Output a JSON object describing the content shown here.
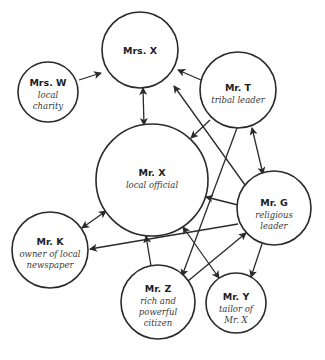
{
  "diagram": {
    "type": "influence network",
    "nodes": [
      {
        "id": "mrs_x",
        "name": "Mrs. X",
        "desc": [],
        "cx": 140,
        "cy": 50,
        "r": 38
      },
      {
        "id": "mrs_w",
        "name": "Mrs. W",
        "desc": [
          "local",
          "charity"
        ],
        "cx": 48,
        "cy": 92,
        "r": 30
      },
      {
        "id": "mr_t",
        "name": "Mr. T",
        "desc": [
          "tribal leader"
        ],
        "cx": 238,
        "cy": 90,
        "r": 38
      },
      {
        "id": "mr_x",
        "name": "Mr. X",
        "desc": [
          "local official"
        ],
        "cx": 152,
        "cy": 180,
        "r": 56
      },
      {
        "id": "mr_g",
        "name": "Mr. G",
        "desc": [
          "religious",
          "leader"
        ],
        "cx": 274,
        "cy": 208,
        "r": 37
      },
      {
        "id": "mr_k",
        "name": "Mr. K",
        "desc": [
          "owner of local",
          "newspaper"
        ],
        "cx": 50,
        "cy": 250,
        "r": 38
      },
      {
        "id": "mr_z",
        "name": "Mr. Z",
        "desc": [
          "rich and",
          "powerful",
          "citizen"
        ],
        "cx": 158,
        "cy": 302,
        "r": 37
      },
      {
        "id": "mr_y",
        "name": "Mr. Y",
        "desc": [
          "tailor of",
          "Mr. X"
        ],
        "cx": 236,
        "cy": 303,
        "r": 30
      }
    ],
    "edges": [
      {
        "from": "mrs_w",
        "to": "mrs_x",
        "direction": "forward",
        "x1": 79,
        "y1": 80,
        "x2": 101,
        "y2": 73
      },
      {
        "from": "mrs_x",
        "to": "mr_x",
        "direction": "both",
        "x1": 143,
        "y1": 88,
        "x2": 144,
        "y2": 125
      },
      {
        "from": "mr_t",
        "to": "mrs_x",
        "direction": "forward",
        "x1": 201,
        "y1": 80,
        "x2": 178,
        "y2": 70
      },
      {
        "from": "mr_g",
        "to": "mrs_x",
        "direction": "forward",
        "x1": 245,
        "y1": 185,
        "x2": 174,
        "y2": 86
      },
      {
        "from": "mr_t",
        "to": "mr_x",
        "direction": "forward",
        "x1": 210,
        "y1": 120,
        "x2": 191,
        "y2": 138
      },
      {
        "from": "mr_t",
        "to": "mr_g",
        "direction": "both",
        "x1": 252,
        "y1": 128,
        "x2": 263,
        "y2": 174
      },
      {
        "from": "mr_t",
        "to": "mr_z",
        "direction": "forward",
        "x1": 237,
        "y1": 128,
        "x2": 182,
        "y2": 276
      },
      {
        "from": "mr_g",
        "to": "mr_x",
        "direction": "forward",
        "x1": 238,
        "y1": 205,
        "x2": 206,
        "y2": 197
      },
      {
        "from": "mr_g",
        "to": "mr_k",
        "direction": "forward",
        "x1": 238,
        "y1": 224,
        "x2": 90,
        "y2": 249
      },
      {
        "from": "mr_g",
        "to": "mr_y",
        "direction": "forward",
        "x1": 262,
        "y1": 244,
        "x2": 251,
        "y2": 277
      },
      {
        "from": "mr_k",
        "to": "mr_x",
        "direction": "both",
        "x1": 82,
        "y1": 228,
        "x2": 106,
        "y2": 211
      },
      {
        "from": "mr_z",
        "to": "mr_x",
        "direction": "forward",
        "x1": 151,
        "y1": 266,
        "x2": 146,
        "y2": 236
      },
      {
        "from": "mr_z",
        "to": "mr_g",
        "direction": "forward",
        "x1": 188,
        "y1": 281,
        "x2": 246,
        "y2": 233
      },
      {
        "from": "mr_x",
        "to": "mr_y",
        "direction": "both",
        "x1": 183,
        "y1": 227,
        "x2": 219,
        "y2": 278
      }
    ]
  },
  "colors": {
    "stroke": "#2a2a2a",
    "name_text": "#1e1e1e",
    "desc_text": "#3a3a3a",
    "background": "#ffffff"
  },
  "labels": {
    "mrs_x": {
      "name": "Mrs. X"
    },
    "mrs_w": {
      "name": "Mrs. W",
      "desc0": "local",
      "desc1": "charity"
    },
    "mr_t": {
      "name": "Mr. T",
      "desc0": "tribal leader"
    },
    "mr_x": {
      "name": "Mr. X",
      "desc0": "local official"
    },
    "mr_g": {
      "name": "Mr. G",
      "desc0": "religious",
      "desc1": "leader"
    },
    "mr_k": {
      "name": "Mr. K",
      "desc0": "owner of local",
      "desc1": "newspaper"
    },
    "mr_z": {
      "name": "Mr. Z",
      "desc0": "rich and",
      "desc1": "powerful",
      "desc2": "citizen"
    },
    "mr_y": {
      "name": "Mr. Y",
      "desc0": "tailor of",
      "desc1": "Mr. X"
    }
  }
}
